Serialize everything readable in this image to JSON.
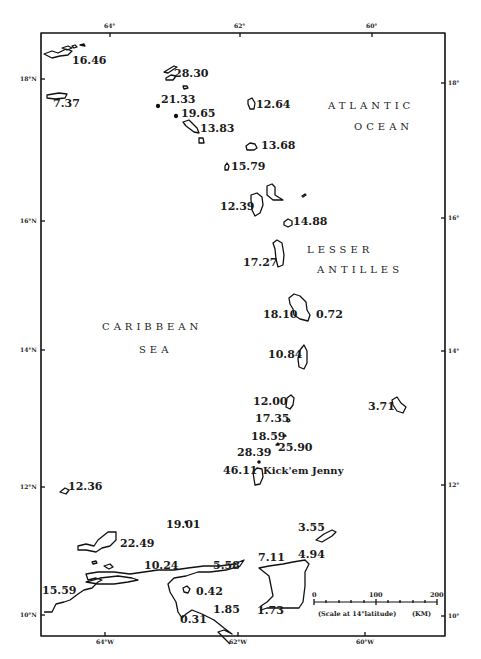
{
  "map": {
    "regions": {
      "atlantic_1": "ATLANTIC",
      "atlantic_2": "OCEAN",
      "antilles_1": "LESSER",
      "antilles_2": "ANTILLES",
      "caribbean_1": "CARIBBEAN",
      "caribbean_2": "SEA"
    },
    "axis": {
      "top": [
        "64°",
        "62°",
        "60°"
      ],
      "bottom": [
        "64°W",
        "62°W",
        "60°W"
      ],
      "left": [
        "18°N",
        "16°N",
        "14°N",
        "12°N",
        "10°N"
      ],
      "right": [
        "18°",
        "16°",
        "14°",
        "12°",
        "10°"
      ]
    },
    "stations": [
      {
        "value": "16.46"
      },
      {
        "value": "7.37"
      },
      {
        "value": "28.30"
      },
      {
        "value": "21.33"
      },
      {
        "value": "19.65"
      },
      {
        "value": "13.83"
      },
      {
        "value": "12.64"
      },
      {
        "value": "13.68"
      },
      {
        "value": "15.79"
      },
      {
        "value": "12.39"
      },
      {
        "value": "14.88"
      },
      {
        "value": "17.27"
      },
      {
        "value": "18.10"
      },
      {
        "value": "0.72"
      },
      {
        "value": "10.84"
      },
      {
        "value": "12.00"
      },
      {
        "value": "17.35"
      },
      {
        "value": "18.59"
      },
      {
        "value": "25.90"
      },
      {
        "value": "28.39"
      },
      {
        "value": "46.11"
      },
      {
        "value": "3.71"
      },
      {
        "value": "12.36"
      },
      {
        "value": "19.01"
      },
      {
        "value": "22.49"
      },
      {
        "value": "10.24"
      },
      {
        "value": "5.58"
      },
      {
        "value": "15.59"
      },
      {
        "value": "0.42"
      },
      {
        "value": "0.31"
      },
      {
        "value": "1.85"
      },
      {
        "value": "3.55"
      },
      {
        "value": "7.11"
      },
      {
        "value": "4.94"
      },
      {
        "value": "1.73"
      }
    ],
    "volcano_label": "Kick'em Jenny",
    "scale": {
      "ticks": [
        "0",
        "100",
        "200"
      ],
      "caption": "(Scale at 14°latitude)",
      "unit": "(KM)"
    }
  }
}
